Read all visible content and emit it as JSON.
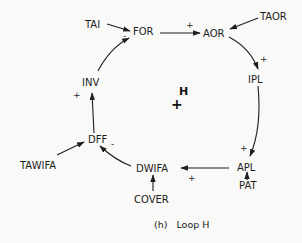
{
  "diagram": {
    "title": "Loop H",
    "caption": "(h)   Loop H",
    "loop_label": "H",
    "loop_polarity": "+",
    "nodes": {
      "tai": "TAI",
      "for": "FOR",
      "aor": "AOR",
      "taor": "TAOR",
      "ipl": "IPL",
      "apl": "APL",
      "pat": "PAT",
      "dwifa": "DWIFA",
      "cover": "COVER",
      "dff": "DFF",
      "tawifa": "TAWIFA",
      "inv": "INV"
    },
    "edges": [
      {
        "from": "TAI",
        "to": "FOR",
        "sign": "-"
      },
      {
        "from": "FOR",
        "to": "AOR",
        "sign": "+"
      },
      {
        "from": "TAOR",
        "to": "AOR",
        "sign": ""
      },
      {
        "from": "AOR",
        "to": "IPL",
        "sign": "+"
      },
      {
        "from": "IPL",
        "to": "APL",
        "sign": "+"
      },
      {
        "from": "PAT",
        "to": "APL",
        "sign": ""
      },
      {
        "from": "APL",
        "to": "DWIFA",
        "sign": "+"
      },
      {
        "from": "COVER",
        "to": "DWIFA",
        "sign": ""
      },
      {
        "from": "DWIFA",
        "to": "DFF",
        "sign": "-"
      },
      {
        "from": "TAWIFA",
        "to": "DFF",
        "sign": ""
      },
      {
        "from": "DFF",
        "to": "INV",
        "sign": "+"
      },
      {
        "from": "INV",
        "to": "FOR",
        "sign": ""
      }
    ],
    "signs": {
      "tai_for": "-",
      "for_aor": "+",
      "aor_ipl": "+",
      "ipl_apl": "+",
      "apl_dwifa": "+",
      "dwifa_dff": "-",
      "dff_inv": "+"
    },
    "colors": {
      "ink": "#1c1c1c",
      "paper": "#f9f9f8"
    }
  }
}
